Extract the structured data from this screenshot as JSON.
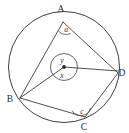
{
  "figure": {
    "type": "circle-geometry-diagram",
    "stroke_color": "#3c3c3c",
    "background_color": "#ffffff"
  },
  "circle": {
    "name": "main-circle",
    "center": {
      "x": 64,
      "y": 67
    },
    "radius": 56
  },
  "centre_marker": {
    "label": "centre-dot",
    "x": 64,
    "y": 67,
    "inner_circle_radius": 14
  },
  "vertices": [
    {
      "id": "A",
      "label": "A",
      "x": 63,
      "y": 22,
      "label_x": 61,
      "label_y": 12
    },
    {
      "id": "B",
      "label": "B",
      "x": 20,
      "y": 98,
      "label_x": 7,
      "label_y": 102
    },
    {
      "id": "C",
      "label": "C",
      "x": 85,
      "y": 117,
      "label_x": 82,
      "label_y": 129
    },
    {
      "id": "D",
      "label": "D",
      "x": 118,
      "y": 73,
      "label_x": 119,
      "label_y": 77
    }
  ],
  "chords": [
    {
      "name": "chord-A-B",
      "from": "A",
      "to": "B"
    },
    {
      "name": "chord-A-D",
      "from": "A",
      "to": "D"
    },
    {
      "name": "chord-B-C",
      "from": "B",
      "to": "C"
    },
    {
      "name": "chord-C-D",
      "from": "C",
      "to": "D"
    }
  ],
  "radii": [
    {
      "name": "radius-centre-B",
      "to": "B"
    },
    {
      "name": "radius-centre-D",
      "to": "D"
    }
  ],
  "angles": [
    {
      "id": "a",
      "label": "a",
      "at_vertex": "A",
      "description": "inscribed angle BAD at vertex A",
      "label_x": 66,
      "label_y": 32
    },
    {
      "id": "c",
      "label": "c",
      "at_vertex": "C",
      "description": "inscribed angle BCD at vertex C",
      "label_x": 79,
      "label_y": 112
    },
    {
      "id": "y",
      "label": "y",
      "at_vertex": "centre",
      "description": "reflex central angle above centre",
      "label_x": 61,
      "label_y": 62
    },
    {
      "id": "x",
      "label": "x",
      "at_vertex": "centre",
      "description": "central angle BOD below centre",
      "label_x": 61,
      "label_y": 77
    }
  ]
}
